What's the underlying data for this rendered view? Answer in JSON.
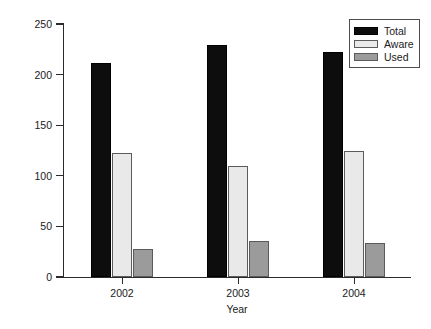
{
  "chart_data": {
    "type": "bar",
    "title": "",
    "xlabel": "Year",
    "ylabel": "No of patients",
    "categories": [
      "2002",
      "2003",
      "2004"
    ],
    "series": [
      {
        "name": "Total",
        "color": "#0d0d0d",
        "values": [
          211,
          229,
          222
        ]
      },
      {
        "name": "Aware",
        "color": "#e9e9e9",
        "values": [
          123,
          110,
          125
        ]
      },
      {
        "name": "Used",
        "color": "#9b9b9b",
        "values": [
          28,
          36,
          34
        ]
      }
    ],
    "ylim": [
      0,
      250
    ],
    "yticks": [
      0,
      50,
      100,
      150,
      200,
      250
    ],
    "ytick_labels": [
      "0",
      "50",
      "100",
      "150",
      "200",
      "250"
    ],
    "xtick_labels": [
      "2002",
      "2003",
      "2004"
    ],
    "grid": false,
    "legend_position": "top-right",
    "legend_entries": [
      "Total",
      "Aware",
      "Used"
    ]
  }
}
